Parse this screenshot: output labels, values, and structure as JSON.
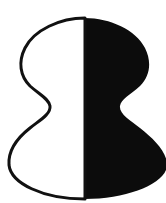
{
  "panel": {
    "width": 166,
    "height": 203,
    "background_color": "#ffffff"
  },
  "label": {
    "text": "c)",
    "color": "#b9b9bd"
  },
  "figure": {
    "name": "bistable-figure-ground-silhouette",
    "outline_color": "#111111",
    "fill_left_color": "#ffffff",
    "fill_right_color": "#0c0c0c",
    "outline_width": 3,
    "split_axis_x": 85,
    "geometry": {
      "top_y": 18,
      "bottom_y": 199,
      "waist_y": 105,
      "upper_lobe_left_x": 21,
      "upper_lobe_right_x": 152,
      "upper_lobe_center_y": 62,
      "lower_lobe_left_x": 8,
      "lower_lobe_right_x": 166,
      "lower_lobe_center_y": 157,
      "waist_left_x": 49,
      "waist_right_x": 122
    },
    "path_left": "M 85,18 C 60,18 34,30 25,48 C 18,62 20,76 30,86 C 40,95 49,99 50,106 C 51,114 40,120 30,128 C 16,139 8,152 9,165 C 11,183 42,199 85,199 Z",
    "path_right": "M 85,18 C 110,18 136,30 145,48 C 152,62 150,76 140,86 C 130,95 121,99 120,106 C 119,114 130,120 140,128 C 154,139 167,152 167,165 C 167,183 128,199 85,199 Z"
  }
}
